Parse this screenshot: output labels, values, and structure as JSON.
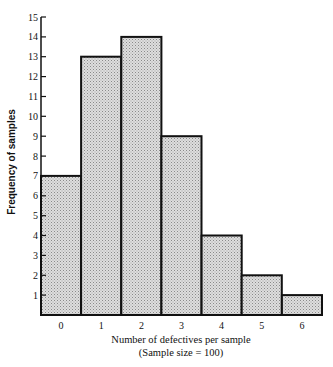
{
  "chart_data": {
    "type": "bar",
    "subtype": "histogram",
    "title": "",
    "categories": [
      "0",
      "1",
      "2",
      "3",
      "4",
      "5",
      "6"
    ],
    "values": [
      7,
      13,
      14,
      9,
      4,
      2,
      1
    ],
    "xlabel": "Number of defectives per sample",
    "xlabel_sub": "(Sample size = 100)",
    "ylabel": "Frequency of samples",
    "ylim": [
      0,
      15
    ],
    "yticks": [
      1,
      2,
      3,
      4,
      5,
      6,
      7,
      8,
      9,
      10,
      11,
      12,
      13,
      14,
      15
    ],
    "grid": false,
    "legend": null,
    "bar_fill": "stippled light gray",
    "bar_edge_color": "#111111"
  },
  "colors": {
    "bar_fill": "#d9d9d9",
    "bar_dot": "#8a8a8a",
    "edge": "#111111",
    "background": "#ffffff"
  },
  "layout": {
    "plot_left": 41,
    "plot_right": 322,
    "baseline_y": 315,
    "top_y": 17
  }
}
